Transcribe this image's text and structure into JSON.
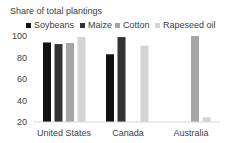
{
  "chart_data": {
    "type": "bar",
    "title": "Share of total plantings",
    "xlabel": "",
    "ylabel": "",
    "ylim": [
      20,
      100
    ],
    "yticks": [
      20,
      40,
      60,
      80,
      100
    ],
    "grid": false,
    "legend_position": "top",
    "categories": [
      "United States",
      "Canada",
      "Australia"
    ],
    "series": [
      {
        "name": "Soybeans",
        "color": "#111111",
        "values": [
          94,
          83,
          null
        ]
      },
      {
        "name": "Maize",
        "color": "#333333",
        "values": [
          92.5,
          99,
          null
        ]
      },
      {
        "name": "Cotton",
        "color": "#a6a6a6",
        "values": [
          93.5,
          null,
          100
        ]
      },
      {
        "name": "Rapeseed oil",
        "color": "#d4d4d4",
        "values": [
          99,
          91,
          24.5
        ]
      }
    ]
  },
  "title": "Share of total plantings",
  "legend": [
    {
      "label": "Soybeans",
      "color": "#111111"
    },
    {
      "label": "Maize",
      "color": "#333333"
    },
    {
      "label": "Cotton",
      "color": "#a6a6a6"
    },
    {
      "label": "Rapeseed oil",
      "color": "#d4d4d4"
    }
  ],
  "yaxis": {
    "ticks": [
      "100",
      "80",
      "60",
      "40",
      "20"
    ]
  },
  "xaxis": {
    "labels": [
      "United States",
      "Canada",
      "Australia"
    ]
  }
}
